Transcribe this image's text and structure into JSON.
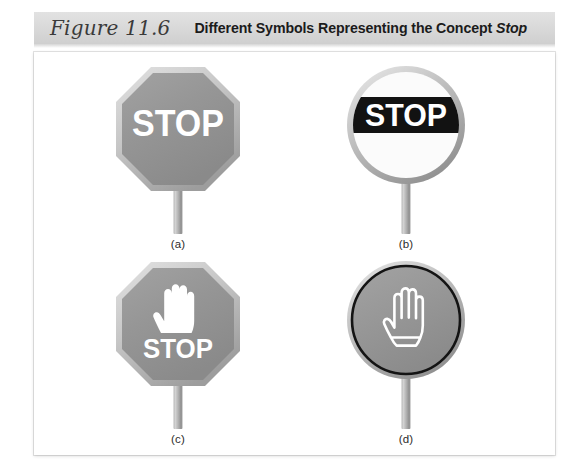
{
  "figure": {
    "number_label": "Figure 11.6",
    "title_main": "Different Symbols Representing the Concept",
    "title_emphasis": "Stop"
  },
  "colors": {
    "header_band": "#d8d8d8",
    "panel_background": "#ffffff",
    "sign_gray_fill": "#939393",
    "sign_light_border": "#c9c9c9",
    "sign_dark_outline": "#141414",
    "sign_white": "#ffffff",
    "pole_gray": "#b0b0b0",
    "text_dark": "#1b1b1b"
  },
  "signs": [
    {
      "id": "a",
      "caption": "(a)",
      "shape": "octagon",
      "shape_name": "octagon-stop-sign",
      "fill": "gray",
      "border_style": "light-gray-bevel",
      "word": "STOP",
      "word_color": "white",
      "has_hand": false,
      "hand_style": "none",
      "description": "Gray octagon with white STOP lettering on a gray post"
    },
    {
      "id": "b",
      "caption": "(b)",
      "shape": "circle",
      "shape_name": "circle-stop-sign",
      "fill": "white",
      "border_style": "light-gray-bevel",
      "word": "STOP",
      "word_color": "white",
      "band_color": "black",
      "has_hand": false,
      "hand_style": "none",
      "description": "White circle with a black horizontal band carrying white STOP lettering"
    },
    {
      "id": "c",
      "caption": "(c)",
      "shape": "octagon",
      "shape_name": "octagon-hand-stop-sign",
      "fill": "gray",
      "border_style": "light-gray-bevel",
      "word": "STOP",
      "word_color": "white",
      "has_hand": true,
      "hand_style": "solid-white-filled",
      "description": "Gray octagon with a solid white raised-hand symbol above white STOP lettering"
    },
    {
      "id": "d",
      "caption": "(d)",
      "shape": "circle",
      "shape_name": "circle-hand-sign",
      "fill": "gray",
      "border_style": "dark-outline",
      "word": "",
      "word_color": "white",
      "has_hand": true,
      "hand_style": "white-outline",
      "description": "Gray circle with a dark outline containing a white outlined raised-hand symbol"
    }
  ]
}
